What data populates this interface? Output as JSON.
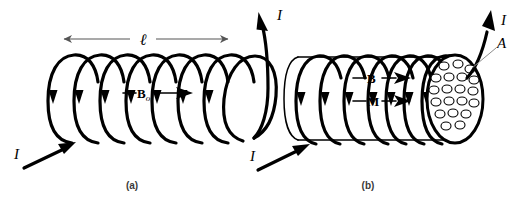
{
  "figure": {
    "background_color": "#ffffff",
    "ink_color": "#000000",
    "dimension_color": "#555555"
  },
  "panels": [
    {
      "id": "a",
      "caption": "(a)",
      "description": "Empty (air-core) solenoid carrying current I",
      "turns": 8,
      "labels": {
        "length_symbol": "ℓ",
        "field_symbol": "B",
        "field_subscript": "o",
        "current_in": "I",
        "current_out": "I"
      }
    },
    {
      "id": "b",
      "caption": "(b)",
      "description": "Solenoid with magnetic core showing B, M and cross-sectional area A",
      "turns": 8,
      "dipole_count": 20,
      "labels": {
        "field_symbol": "B",
        "magnetization_symbol": "M",
        "area_symbol": "A",
        "current_in": "I",
        "current_out": "I"
      }
    }
  ],
  "annotations": {
    "length_arrow_label": "ℓ",
    "b_naught_label": "B",
    "b_naught_sub": "o",
    "b_label": "B",
    "m_label": "M",
    "a_label": "A",
    "current_label": "I",
    "caption_a": "(a)",
    "caption_b": "(b)"
  }
}
